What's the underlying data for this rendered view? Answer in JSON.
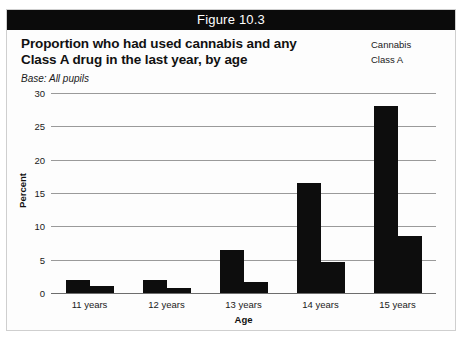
{
  "figure": {
    "header_label": "Figure 10.3",
    "title_line1": "Proportion who had used cannabis and any",
    "title_line2": "Class A drug in the last year, by age",
    "base_note": "Base: All pupils"
  },
  "legend": {
    "items": [
      {
        "label": "Cannabis",
        "color": "#0d0d0d"
      },
      {
        "label": "Class A",
        "color": "#0d0d0d"
      }
    ]
  },
  "chart_data": {
    "type": "bar",
    "title": "Proportion who had used cannabis and any Class A drug in the last year, by age",
    "subtitle": "Base: All pupils",
    "categories": [
      "11 years",
      "12 years",
      "13 years",
      "14 years",
      "15 years"
    ],
    "series": [
      {
        "name": "Cannabis",
        "values": [
          2.0,
          2.0,
          6.5,
          16.5,
          28.0
        ],
        "color": "#0d0d0d"
      },
      {
        "name": "Class A",
        "values": [
          1.0,
          0.8,
          1.7,
          4.7,
          8.5
        ],
        "color": "#0d0d0d"
      }
    ],
    "xlabel": "Age",
    "ylabel": "Percent",
    "ylim": [
      0,
      30
    ],
    "yticks": [
      0,
      5,
      10,
      15,
      20,
      25,
      30
    ],
    "ytick_labels": [
      "0",
      "5",
      "10",
      "15",
      "20",
      "25",
      "30"
    ],
    "grid": true,
    "legend_position": "top-right"
  }
}
